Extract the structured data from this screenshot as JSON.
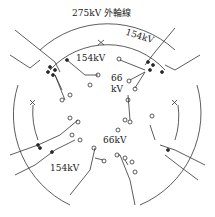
{
  "diagram": {
    "labels": {
      "outer_ring": "275kV 外輪線",
      "ring_154_upper_right": "154kV",
      "ring_154_upper_left": "154kV",
      "ring_66_center_top_line1": "66",
      "ring_66_center_top_line2": "kV",
      "ring_66_center_bottom": "66kV",
      "ring_154_lower_left": "154kV"
    },
    "colors": {
      "line": "#333333",
      "background": "#ffffff"
    }
  }
}
